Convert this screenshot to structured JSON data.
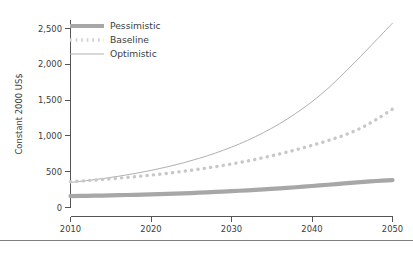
{
  "chart_data": {
    "type": "line",
    "title": "",
    "subtitle": "",
    "xlabel": "",
    "ylabel": "Constant 2000 US$",
    "xlim": [
      2010,
      2050
    ],
    "ylim": [
      0,
      2600
    ],
    "grid": false,
    "legend_position": "top-left-inside",
    "x_ticks": [
      2010,
      2020,
      2030,
      2040,
      2050
    ],
    "x_tick_labels": [
      "2010",
      "2020",
      "2030",
      "2040",
      "2050"
    ],
    "y_ticks": [
      0,
      500,
      1000,
      1500,
      2000,
      2500
    ],
    "y_tick_labels": [
      "0",
      "500",
      "1,000",
      "1,500",
      "2,000",
      "2,500"
    ],
    "x": [
      2010,
      2012,
      2014,
      2016,
      2018,
      2020,
      2022,
      2024,
      2026,
      2028,
      2030,
      2032,
      2034,
      2036,
      2038,
      2040,
      2042,
      2044,
      2046,
      2048,
      2050
    ],
    "series": [
      {
        "name": "Pessimistic",
        "style": "solid-thick",
        "color": "#a7a7a7",
        "values": [
          160,
          163,
          167,
          172,
          177,
          183,
          190,
          198,
          207,
          217,
          228,
          240,
          253,
          267,
          283,
          300,
          318,
          337,
          355,
          370,
          382
        ]
      },
      {
        "name": "Baseline",
        "style": "dotted",
        "color": "#c8c8c8",
        "values": [
          360,
          375,
          392,
          410,
          430,
          452,
          477,
          505,
          536,
          570,
          608,
          650,
          697,
          749,
          806,
          868,
          935,
          1010,
          1105,
          1230,
          1375
        ]
      },
      {
        "name": "Optimistic",
        "style": "solid-thin",
        "color": "#b0b0b0",
        "values": [
          350,
          375,
          404,
          437,
          475,
          518,
          567,
          623,
          687,
          760,
          843,
          938,
          1047,
          1172,
          1315,
          1478,
          1665,
          1880,
          2105,
          2340,
          2575
        ]
      }
    ],
    "legend": [
      {
        "label": "Pessimistic"
      },
      {
        "label": "Baseline"
      },
      {
        "label": "Optimistic"
      }
    ]
  }
}
